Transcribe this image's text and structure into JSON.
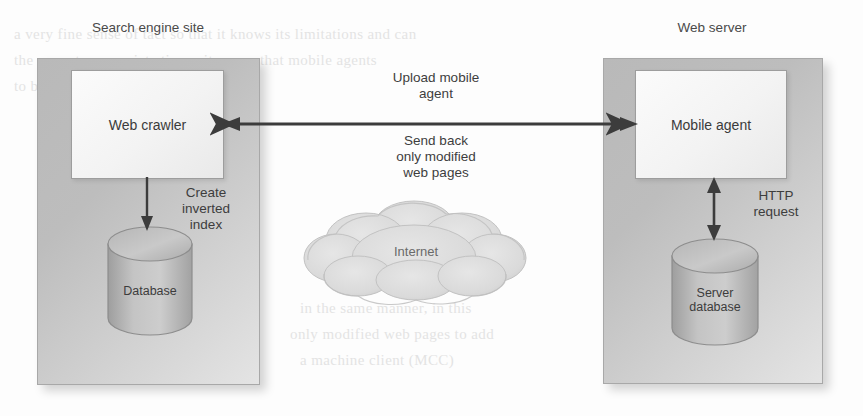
{
  "diagram": {
    "type": "architecture-diagram",
    "left_panel": {
      "title": "Search engine site",
      "node": {
        "label": "Web crawler"
      },
      "datastore": {
        "label": "Database"
      },
      "internal_edge_label": "Create\ninverted\nindex"
    },
    "right_panel": {
      "title": "Web server",
      "node": {
        "label": "Mobile agent"
      },
      "datastore": {
        "label": "Server\ndatabase"
      },
      "internal_edge_label": "HTTP\nrequest"
    },
    "network": {
      "cloud_label": "Internet",
      "edge_label_top": "Upload mobile\nagent",
      "edge_label_bottom": "Send back\nonly modified\nweb pages"
    },
    "colors": {
      "panel_fill": "#bdbdbd",
      "node_fill": "#f5f5f5",
      "arrow": "#3c3c3c",
      "text": "#3a3a3a",
      "cloud": "#d8d8d8",
      "page_background": "#fdfdfd"
    }
  },
  "page_bleed": [
    "a very fine sense of tact so that it knows its limitations and can",
    "the user at appropriate times, it seems that mobile agents",
    "to become just another paradigm.",
    "in the same manner, in this",
    "only modified web pages to add",
    "a machine client (MCC)"
  ]
}
